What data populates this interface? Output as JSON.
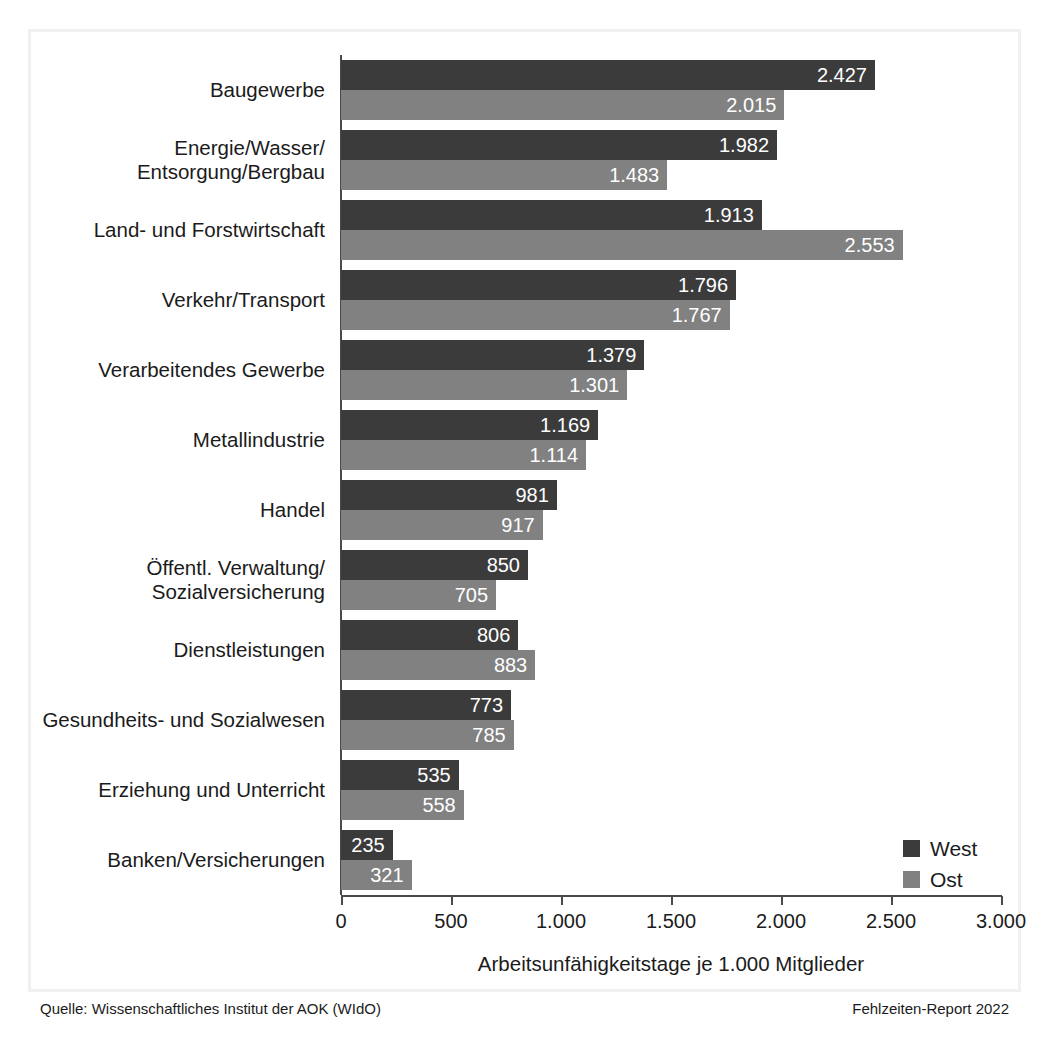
{
  "chart_data": {
    "type": "bar",
    "orientation": "horizontal",
    "title": "",
    "xlabel": "Arbeitsunfähigkeitstage je 1.000 Mitglieder",
    "ylabel": "",
    "xlim": [
      0,
      3000
    ],
    "grid": false,
    "legend_position": "bottom-right",
    "tick_labels": [
      "0",
      "500",
      "1.000",
      "1.500",
      "2.000",
      "2.500",
      "3.000"
    ],
    "ticks": [
      0,
      500,
      1000,
      1500,
      2000,
      2500,
      3000
    ],
    "categories": [
      "Baugewerbe",
      "Energie/Wasser/\nEntsorgung/Bergbau",
      "Land- und Forstwirtschaft",
      "Verkehr/Transport",
      "Verarbeitendes Gewerbe",
      "Metallindustrie",
      "Handel",
      "Öffentl. Verwaltung/\nSozialversicherung",
      "Dienstleistungen",
      "Gesundheits- und Sozialwesen",
      "Erziehung und Unterricht",
      "Banken/Versicherungen"
    ],
    "series": [
      {
        "name": "West",
        "color": "#3b3b3b",
        "values": [
          2427,
          1982,
          1913,
          1796,
          1379,
          1169,
          981,
          850,
          806,
          773,
          535,
          235
        ],
        "labels": [
          "2.427",
          "1.982",
          "1.913",
          "1.796",
          "1.379",
          "1.169",
          "981",
          "850",
          "806",
          "773",
          "535",
          "235"
        ]
      },
      {
        "name": "Ost",
        "color": "#818181",
        "values": [
          2015,
          1483,
          2553,
          1767,
          1301,
          1114,
          917,
          705,
          883,
          785,
          558,
          321
        ],
        "labels": [
          "2.015",
          "1.483",
          "2.553",
          "1.767",
          "1.301",
          "1.114",
          "917",
          "705",
          "883",
          "785",
          "558",
          "321"
        ]
      }
    ]
  },
  "legend": {
    "items": [
      {
        "label": "West",
        "color": "#3b3b3b"
      },
      {
        "label": "Ost",
        "color": "#818181"
      }
    ]
  },
  "footer": {
    "source": "Quelle: Wissenschaftliches Institut der AOK (WIdO)",
    "report": "Fehlzeiten-Report 2022"
  }
}
